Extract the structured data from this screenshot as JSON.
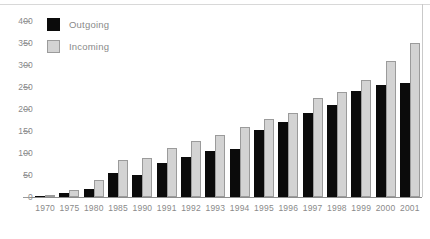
{
  "chart_data": {
    "type": "bar",
    "title": "",
    "subtitle": "",
    "xlabel": "",
    "ylabel": "",
    "grid": false,
    "legend_position": "top-left",
    "ylim": [
      0,
      400
    ],
    "yticks": [
      400,
      350,
      300,
      250,
      200,
      150,
      100,
      50,
      0
    ],
    "categories": [
      "1970",
      "1975",
      "1980",
      "1985",
      "1990",
      "1991",
      "1992",
      "1993",
      "1994",
      "1995",
      "1996",
      "1997",
      "1998",
      "1999",
      "2000",
      "2001"
    ],
    "series": [
      {
        "name": "Outgoing",
        "color": "#0b0b0b",
        "values": [
          3,
          8,
          18,
          55,
          50,
          77,
          90,
          105,
          110,
          152,
          170,
          190,
          210,
          240,
          255,
          258
        ]
      },
      {
        "name": "Incoming",
        "color": "#d3d3d3",
        "values": [
          4,
          15,
          38,
          85,
          88,
          112,
          128,
          140,
          160,
          178,
          192,
          225,
          238,
          265,
          310,
          350
        ]
      }
    ]
  },
  "legend": {
    "items": [
      {
        "label": "Outgoing",
        "swatch": "black-square-icon"
      },
      {
        "label": "Incoming",
        "swatch": "gray-square-icon"
      }
    ]
  },
  "colors": {
    "outgoing": "#0b0b0b",
    "incoming": "#d3d3d3",
    "incoming_border": "#9b9b9b",
    "axis": "#8d8d8d",
    "tick_text": "#8a8a8a",
    "background": "#ffffff"
  }
}
